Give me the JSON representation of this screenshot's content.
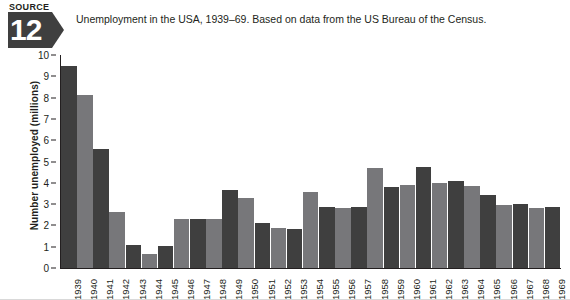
{
  "source": {
    "word": "SOURCE",
    "number": "12",
    "badge_color": "#3f3f3f"
  },
  "caption": "Unemployment in the USA, 1939–69. Based on data from the US Bureau of the Census.",
  "colors": {
    "bar_dark": "#3f3f3f",
    "bar_light": "#77777a",
    "axis": "#231f20",
    "background": "#ffffff"
  },
  "chart_data": {
    "type": "bar",
    "title": "Unemployment in the USA, 1939–69. Based on data from the US Bureau of the Census.",
    "xlabel": "",
    "ylabel": "Number unemployed (millions)",
    "ylim": [
      0,
      10
    ],
    "yticks": [
      0,
      1,
      2,
      3,
      4,
      5,
      6,
      7,
      8,
      9,
      10
    ],
    "grid": false,
    "legend": "none",
    "categories": [
      "1939",
      "1940",
      "1941",
      "1942",
      "1943",
      "1944",
      "1945",
      "1946",
      "1947",
      "1948",
      "1949",
      "1950",
      "1951",
      "1952",
      "1953",
      "1954",
      "1955",
      "1956",
      "1957",
      "1958",
      "1959",
      "1960",
      "1961",
      "1962",
      "1963",
      "1964",
      "1965",
      "1966",
      "1967",
      "1968",
      "1969"
    ],
    "values": [
      9.5,
      8.1,
      5.6,
      2.65,
      1.1,
      0.68,
      1.05,
      2.3,
      2.3,
      2.3,
      3.65,
      3.3,
      2.1,
      1.9,
      1.85,
      3.55,
      2.85,
      2.8,
      2.85,
      4.7,
      3.8,
      3.9,
      4.75,
      4.0,
      4.1,
      3.85,
      3.45,
      2.95,
      3.0,
      2.8,
      2.85
    ]
  }
}
